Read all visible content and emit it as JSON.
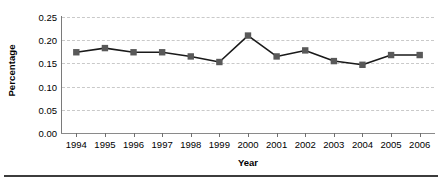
{
  "chart_data": {
    "type": "line",
    "title": "",
    "xlabel": "Year",
    "ylabel": "Percentage",
    "categories": [
      "1994",
      "1995",
      "1996",
      "1997",
      "1998",
      "1999",
      "2000",
      "2001",
      "2002",
      "2003",
      "2004",
      "2005",
      "2006"
    ],
    "values": [
      0.174,
      0.183,
      0.174,
      0.174,
      0.165,
      0.153,
      0.21,
      0.165,
      0.178,
      0.155,
      0.147,
      0.168,
      0.168
    ],
    "ylim": [
      0.0,
      0.25
    ],
    "yticks": [
      "0.00",
      "0.05",
      "0.10",
      "0.15",
      "0.20",
      "0.25"
    ],
    "ytick_values": [
      0.0,
      0.05,
      0.1,
      0.15,
      0.2,
      0.25
    ],
    "grid": "horizontal-dashed",
    "legend": "none",
    "series_color": "#595959",
    "marker": "square",
    "line_color": "#1a1a1a",
    "grid_color": "#c9c9c9"
  }
}
